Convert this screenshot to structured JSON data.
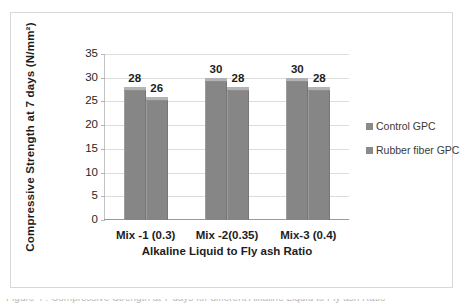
{
  "chart_data": {
    "type": "bar",
    "title": "",
    "categories": [
      "Mix -1 (0.3)",
      "Mix -2(0.35)",
      "Mix-3 (0.4)"
    ],
    "series": [
      {
        "name": "Control GPC",
        "values": [
          28,
          30,
          30
        ],
        "color": "#868686"
      },
      {
        "name": "Rubber fiber GPC",
        "values": [
          26,
          28,
          28
        ],
        "color": "#868686"
      }
    ],
    "xlabel": "Alkaline Liquid to Fly ash Ratio",
    "ylabel": "Compressive Strength at 7 days  (N/mm²)",
    "ylim": [
      0,
      35
    ],
    "yticks": [
      0,
      5,
      10,
      15,
      20,
      25,
      30,
      35
    ],
    "ytick_labels": [
      "0",
      "5",
      "10",
      "15",
      "20",
      "25",
      "30",
      "35"
    ],
    "grid": "horizontal",
    "legend_position": "right",
    "data_labels": true
  },
  "axes": {
    "y_title": "Compressive Strength at 7 days  (N/mm²)",
    "x_title": "Alkaline Liquid to Fly ash Ratio"
  },
  "legend": {
    "items": [
      {
        "label": "Control GPC",
        "swatch_color": "#8a8a8a"
      },
      {
        "label": "Rubber fiber GPC",
        "swatch_color": "#8a8a8a"
      }
    ]
  },
  "caption": {
    "sliver_text": "Figure 4 : Compressive Strength at 7 days for different Alkaline Liquid to Fly ash Ratio"
  },
  "colors": {
    "bar_fill": "#868686",
    "bar_top_cap": "#b3b3b3",
    "gridline": "#dcdcdc",
    "frame_border": "#d8d8d8",
    "axis_line": "#9a9a9a",
    "text": "#1d1d1d"
  }
}
